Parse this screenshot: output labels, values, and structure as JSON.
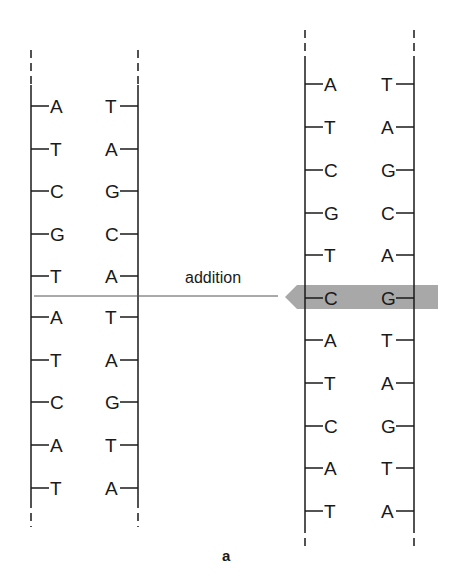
{
  "figure": {
    "caption": "a",
    "annotation": "addition",
    "colors": {
      "ink": "#1a1a1a",
      "highlight": "#a8a8a8",
      "rule": "#555555"
    },
    "left_strand": {
      "pairs": [
        [
          "A",
          "T"
        ],
        [
          "T",
          "A"
        ],
        [
          "C",
          "G"
        ],
        [
          "G",
          "C"
        ],
        [
          "T",
          "A"
        ],
        [
          "A",
          "T"
        ],
        [
          "T",
          "A"
        ],
        [
          "C",
          "G"
        ],
        [
          "A",
          "T"
        ],
        [
          "T",
          "A"
        ]
      ],
      "insertion_after_index": 4
    },
    "right_strand": {
      "pairs": [
        [
          "A",
          "T"
        ],
        [
          "T",
          "A"
        ],
        [
          "C",
          "G"
        ],
        [
          "G",
          "C"
        ],
        [
          "T",
          "A"
        ],
        [
          "C",
          "G"
        ],
        [
          "A",
          "T"
        ],
        [
          "T",
          "A"
        ],
        [
          "C",
          "G"
        ],
        [
          "A",
          "T"
        ],
        [
          "T",
          "A"
        ]
      ],
      "highlighted_index": 5
    }
  }
}
